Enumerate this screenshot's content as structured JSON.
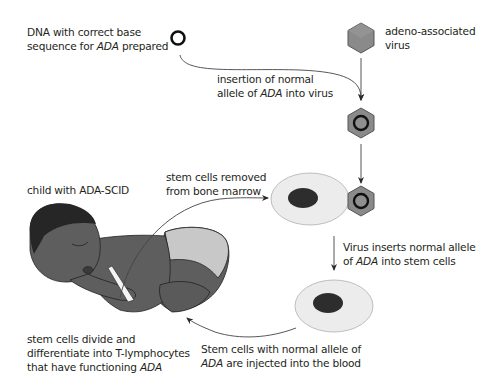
{
  "labels": {
    "dna": {
      "line1": "DNA with correct base",
      "line2_pre": "sequence for ",
      "line2_italic": "ADA",
      "line2_post": " prepared"
    },
    "virus": {
      "line1": "adeno-associated",
      "line2": "virus"
    },
    "insertion": {
      "line1": "insertion of normal",
      "line2_pre": "allele of ",
      "line2_italic": "ADA",
      "line2_post": " into virus"
    },
    "child": {
      "line1": "child with ADA-SCID"
    },
    "stem_removed": {
      "line1": "stem cells removed",
      "line2": "from bone marrow"
    },
    "virus_inserts": {
      "line1": "Virus inserts normal allele",
      "line2_pre": "of ",
      "line2_italic": "ADA",
      "line2_post": " into stem cells"
    },
    "injected": {
      "line1": "Stem cells with normal allele of",
      "line2_italic": "ADA",
      "line2_post": " are injected into the blood"
    },
    "differentiate": {
      "line1": "stem cells divide and",
      "line2": "differentiate into T-lymphocytes",
      "line3_pre": "that have functioning ",
      "line3_italic": "ADA"
    }
  },
  "colors": {
    "text": "#231f20",
    "line": "#3a3a3a",
    "hexagon_fill": "#8a8a8a",
    "hexagon_stroke": "#4a4a4a",
    "cell_fill": "#ececec",
    "cell_stroke": "#b5b5b5",
    "nucleus_fill": "#2d2d2d",
    "skin": "#5e5e5e",
    "hair": "#262626",
    "diaper": "#c8c8c8"
  }
}
